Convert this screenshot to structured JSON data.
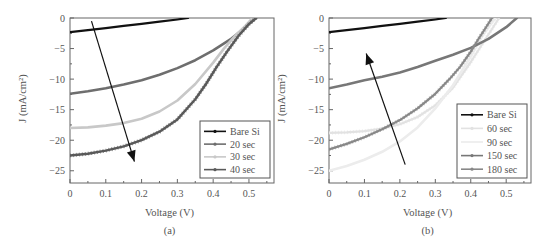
{
  "chart_data": [
    {
      "type": "line",
      "panel_label": "(a)",
      "title": "",
      "xlabel": "Voltage (V)",
      "ylabel": "J (mA/cm²)",
      "xlim": [
        0,
        0.57
      ],
      "ylim": [
        -27,
        0
      ],
      "xticks": [
        0,
        0.1,
        0.2,
        0.3,
        0.4,
        0.5
      ],
      "xtick_labels": [
        "0",
        "0.1",
        "0.2",
        "0.3",
        "0.4",
        "0.5"
      ],
      "yticks": [
        0,
        -5,
        -10,
        -15,
        -20,
        -25
      ],
      "ytick_labels": [
        "0",
        "−5",
        "−10",
        "−15",
        "−20",
        "−25"
      ],
      "grid": false,
      "legend_position": "lower right",
      "annotation": {
        "type": "arrow",
        "from": [
          0.06,
          -0.5
        ],
        "to": [
          0.18,
          -23.5
        ],
        "meaning": "increasing etch time, Jsc increases"
      },
      "series": [
        {
          "name": "Bare Si",
          "color": "#111111",
          "width": 2.2,
          "marker": "square",
          "x": [
            0,
            0.05,
            0.1,
            0.15,
            0.2,
            0.25,
            0.3,
            0.33
          ],
          "y": [
            -2.3,
            -2.0,
            -1.65,
            -1.3,
            -0.95,
            -0.6,
            -0.25,
            0
          ]
        },
        {
          "name": "20 sec",
          "color": "#6e6e6e",
          "width": 2.6,
          "marker": "circle",
          "x": [
            0,
            0.05,
            0.1,
            0.15,
            0.2,
            0.25,
            0.3,
            0.35,
            0.4,
            0.45,
            0.48,
            0.5,
            0.52
          ],
          "y": [
            -12.4,
            -12.0,
            -11.5,
            -10.9,
            -10.2,
            -9.3,
            -8.2,
            -6.9,
            -5.3,
            -3.4,
            -2.0,
            -1.0,
            0
          ]
        },
        {
          "name": "30 sec",
          "color": "#c8c8c8",
          "width": 2.6,
          "marker": "triangle",
          "x": [
            0,
            0.05,
            0.1,
            0.15,
            0.2,
            0.25,
            0.3,
            0.35,
            0.4,
            0.43,
            0.46,
            0.49,
            0.51
          ],
          "y": [
            -18.0,
            -17.9,
            -17.6,
            -17.2,
            -16.5,
            -15.3,
            -13.5,
            -10.8,
            -7.3,
            -5.0,
            -3.0,
            -1.3,
            0
          ]
        },
        {
          "name": "40 sec",
          "color": "#5a5a5a",
          "width": 2.4,
          "marker": "triangle-down",
          "x": [
            0,
            0.05,
            0.1,
            0.15,
            0.2,
            0.25,
            0.3,
            0.35,
            0.38,
            0.41,
            0.44,
            0.47,
            0.5,
            0.52
          ],
          "y": [
            -22.5,
            -22.2,
            -21.7,
            -21.0,
            -20.0,
            -18.6,
            -16.6,
            -13.3,
            -10.8,
            -8.0,
            -5.4,
            -3.0,
            -1.0,
            0
          ]
        }
      ]
    },
    {
      "type": "line",
      "panel_label": "(b)",
      "title": "",
      "xlabel": "Voltage (V)",
      "ylabel": "J (mA/cm²)",
      "xlim": [
        0,
        0.57
      ],
      "ylim": [
        -27,
        0
      ],
      "xticks": [
        0,
        0.1,
        0.2,
        0.3,
        0.4,
        0.5
      ],
      "xtick_labels": [
        "0",
        "0.1",
        "0.2",
        "0.3",
        "0.4",
        "0.5"
      ],
      "yticks": [
        0,
        -5,
        -10,
        -15,
        -20,
        -25
      ],
      "ytick_labels": [
        "0",
        "−5",
        "−10",
        "−15",
        "−20",
        "−25"
      ],
      "grid": false,
      "legend_position": "lower right",
      "annotation": {
        "type": "arrow",
        "from": [
          0.215,
          -24
        ],
        "to": [
          0.105,
          -5.8
        ],
        "meaning": "longer etch time, Jsc decreases"
      },
      "series": [
        {
          "name": "Bare Si",
          "color": "#111111",
          "width": 2.2,
          "marker": "square",
          "x": [
            0,
            0.05,
            0.1,
            0.15,
            0.2,
            0.25,
            0.3,
            0.33
          ],
          "y": [
            -2.3,
            -2.0,
            -1.65,
            -1.3,
            -0.95,
            -0.6,
            -0.25,
            0
          ]
        },
        {
          "name": "60 sec",
          "color": "#e2e2e2",
          "width": 2.2,
          "marker": "plus",
          "x": [
            0,
            0.05,
            0.1,
            0.15,
            0.2,
            0.25,
            0.3,
            0.35,
            0.4,
            0.44,
            0.46,
            0.48
          ],
          "y": [
            -18.8,
            -18.7,
            -18.5,
            -18.1,
            -17.4,
            -16.2,
            -14.3,
            -11.4,
            -7.2,
            -3.6,
            -1.8,
            0
          ]
        },
        {
          "name": "90 sec",
          "color": "#ececec",
          "width": 2.6,
          "marker": "none",
          "x": [
            0,
            0.05,
            0.1,
            0.15,
            0.2,
            0.25,
            0.3,
            0.35,
            0.4,
            0.43,
            0.45,
            0.47
          ],
          "y": [
            -25.0,
            -24.2,
            -23.2,
            -21.9,
            -20.2,
            -17.9,
            -14.8,
            -11.0,
            -6.3,
            -3.2,
            -1.5,
            0
          ]
        },
        {
          "name": "150 sec",
          "color": "#777777",
          "width": 2.6,
          "marker": "circle",
          "x": [
            0,
            0.05,
            0.1,
            0.15,
            0.2,
            0.25,
            0.3,
            0.35,
            0.4,
            0.45,
            0.5,
            0.53
          ],
          "y": [
            -11.5,
            -10.9,
            -10.2,
            -9.6,
            -8.9,
            -8.0,
            -7.0,
            -6.0,
            -4.9,
            -3.4,
            -1.5,
            0
          ]
        },
        {
          "name": "180 sec",
          "color": "#888888",
          "width": 2.2,
          "marker": "plus",
          "x": [
            0,
            0.05,
            0.1,
            0.15,
            0.2,
            0.25,
            0.3,
            0.34,
            0.37,
            0.4,
            0.42,
            0.44,
            0.46
          ],
          "y": [
            -21.5,
            -20.6,
            -19.5,
            -18.2,
            -16.7,
            -14.8,
            -12.4,
            -10.0,
            -8.0,
            -5.5,
            -3.6,
            -1.8,
            0
          ]
        }
      ]
    }
  ]
}
